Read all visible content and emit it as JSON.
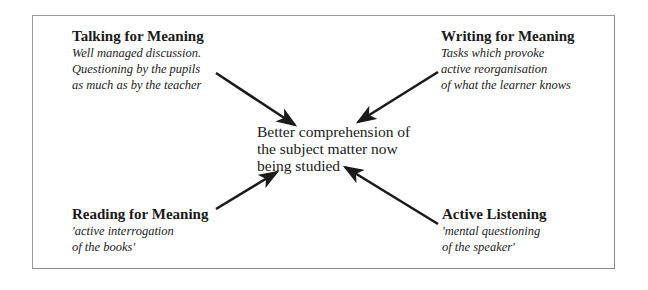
{
  "diagram": {
    "center": {
      "lines": [
        "Better comprehension of",
        "the subject matter now",
        "being studied"
      ]
    },
    "nodes": {
      "talking": {
        "heading": "Talking for Meaning",
        "desc": [
          "Well managed discussion.",
          "Questioning by the pupils",
          "as much as by the teacher"
        ]
      },
      "writing": {
        "heading": "Writing for Meaning",
        "desc": [
          "Tasks which provoke",
          "active reorganisation",
          "of what the learner knows"
        ]
      },
      "reading": {
        "heading": "Reading for Meaning",
        "desc": [
          "'active interrogation",
          "of the books'"
        ]
      },
      "listening": {
        "heading": "Active Listening",
        "desc": [
          "'mental questioning",
          "of the speaker'"
        ]
      }
    },
    "arrows": [
      {
        "from": "talking",
        "to": "center",
        "x1": 216,
        "y1": 73,
        "x2": 295,
        "y2": 125
      },
      {
        "from": "writing",
        "to": "center",
        "x1": 438,
        "y1": 72,
        "x2": 358,
        "y2": 122
      },
      {
        "from": "reading",
        "to": "center",
        "x1": 216,
        "y1": 209,
        "x2": 277,
        "y2": 172
      },
      {
        "from": "listening",
        "to": "center",
        "x1": 438,
        "y1": 224,
        "x2": 345,
        "y2": 167
      }
    ],
    "colors": {
      "ink": "#1a1a1a",
      "frame": "#9a9a9a",
      "background": "#ffffff"
    }
  }
}
